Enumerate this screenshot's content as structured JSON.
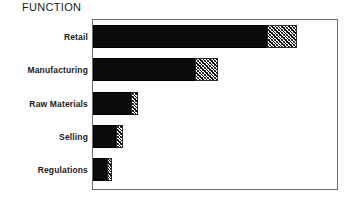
{
  "chart_data": {
    "type": "bar",
    "orientation": "horizontal",
    "stacked": true,
    "title": "FUNCTION",
    "xlabel": "",
    "ylabel": "",
    "grid": false,
    "legend": "none",
    "categories": [
      "Retail",
      "Manufacturing",
      "Raw Materials",
      "Selling",
      "Regulations"
    ],
    "xlim": [
      0,
      100
    ],
    "series": [
      {
        "name": "solid",
        "fill": "solid-black",
        "color": "#0b0b0b",
        "values": [
          70.7,
          41.5,
          15.4,
          9.3,
          5.7
        ]
      },
      {
        "name": "hatched",
        "fill": "cross-hatch",
        "color": "#ffffff",
        "values": [
          12.2,
          9.3,
          2.9,
          2.9,
          2.0
        ]
      }
    ],
    "totals": [
      82.9,
      50.8,
      18.3,
      12.2,
      7.7
    ]
  },
  "chart": {
    "title": "FUNCTION",
    "frame_color": "#6d6d6d",
    "background": "#ffffff",
    "bars": [
      {
        "label": "Retail",
        "top": 25,
        "height": 23,
        "solid_start": 93,
        "solid_end": 267,
        "hatch_end": 297
      },
      {
        "label": "Manufacturing",
        "top": 58,
        "height": 23,
        "solid_start": 93,
        "solid_end": 195,
        "hatch_end": 218
      },
      {
        "label": "Raw Materials",
        "top": 92,
        "height": 23,
        "solid_start": 93,
        "solid_end": 131,
        "hatch_end": 138
      },
      {
        "label": "Selling",
        "top": 125,
        "height": 23,
        "solid_start": 93,
        "solid_end": 116,
        "hatch_end": 123
      },
      {
        "label": "Regulations",
        "top": 158,
        "height": 23,
        "solid_start": 93,
        "solid_end": 107,
        "hatch_end": 112
      }
    ],
    "label_positions": [
      {
        "text": "Retail",
        "top": 13
      },
      {
        "text": "Manufacturing",
        "top": 46
      },
      {
        "text": "Raw Materials",
        "top": 80
      },
      {
        "text": "Selling",
        "top": 113
      },
      {
        "text": "Regulations",
        "top": 146
      }
    ]
  }
}
